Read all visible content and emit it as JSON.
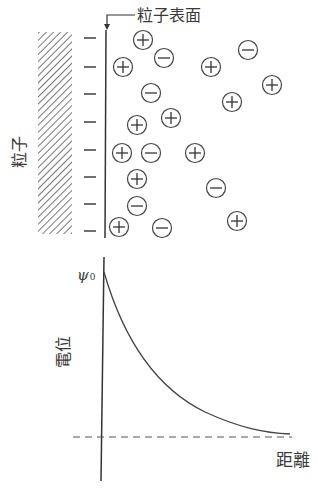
{
  "labels": {
    "surface": "粒子表面",
    "particle": "粒子",
    "potential_axis": "電位",
    "distance_axis": "距離",
    "psi_symbol": "ψ",
    "psi_subscript": "0"
  },
  "colors": {
    "line": "#333333",
    "hatch": "#555555",
    "background": "#ffffff"
  },
  "diagram": {
    "surface_charges": [
      38,
      67,
      94,
      122,
      150,
      177,
      204,
      231
    ],
    "ions": [
      {
        "sign": "+",
        "x": 143,
        "y": 40
      },
      {
        "sign": "-",
        "x": 164,
        "y": 58
      },
      {
        "sign": "+",
        "x": 123,
        "y": 67
      },
      {
        "sign": "+",
        "x": 211,
        "y": 67
      },
      {
        "sign": "-",
        "x": 248,
        "y": 50
      },
      {
        "sign": "+",
        "x": 272,
        "y": 85
      },
      {
        "sign": "-",
        "x": 151,
        "y": 93
      },
      {
        "sign": "+",
        "x": 232,
        "y": 102
      },
      {
        "sign": "+",
        "x": 171,
        "y": 118
      },
      {
        "sign": "+",
        "x": 137,
        "y": 125
      },
      {
        "sign": "+",
        "x": 122,
        "y": 153
      },
      {
        "sign": "-",
        "x": 151,
        "y": 153
      },
      {
        "sign": "+",
        "x": 195,
        "y": 153
      },
      {
        "sign": "+",
        "x": 137,
        "y": 179
      },
      {
        "sign": "-",
        "x": 216,
        "y": 188
      },
      {
        "sign": "-",
        "x": 137,
        "y": 206
      },
      {
        "sign": "+",
        "x": 119,
        "y": 227
      },
      {
        "sign": "-",
        "x": 162,
        "y": 228
      },
      {
        "sign": "+",
        "x": 237,
        "y": 221
      }
    ]
  },
  "chart_data": {
    "type": "line",
    "title": "",
    "xlabel": "距離",
    "ylabel": "電位",
    "y_start_label": "ψ0",
    "x": [
      0,
      0.1,
      0.2,
      0.3,
      0.4,
      0.5,
      0.6,
      0.7,
      0.8,
      0.9,
      1.0
    ],
    "values": [
      1.0,
      0.68,
      0.47,
      0.33,
      0.23,
      0.16,
      0.11,
      0.07,
      0.05,
      0.03,
      0.02
    ],
    "grid": false,
    "baseline": 0
  }
}
